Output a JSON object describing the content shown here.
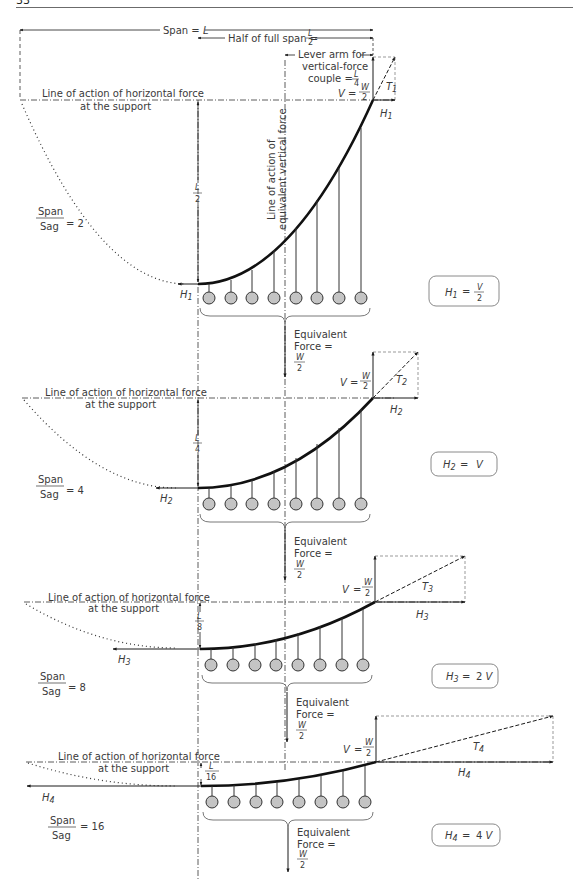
{
  "header": {
    "page_number": "33"
  },
  "top_dimensions": {
    "span": "Span = L",
    "half_span": "Half of full span = L/2",
    "lever_arm_line1": "Lever arm for",
    "lever_arm_line2": "vertical-force",
    "lever_arm_line3": "couple = L/4",
    "line_of_action_vertical": "Line of action of equivalent vertical force"
  },
  "common": {
    "horizontal_force_line1": "Line of action of horizontal force",
    "horizontal_force_line2": "at the support",
    "equivalent_line1": "Equivalent",
    "equivalent_line2": "Force =",
    "W": "W",
    "two": "2",
    "V_eq": "V  =",
    "span": "Span",
    "sag": "Sag",
    "L": "L"
  },
  "panels": [
    {
      "ratio": "= 2",
      "sag_den": "2",
      "H": "H₁",
      "T": "T₁",
      "formula": "H₁  =  V / 2"
    },
    {
      "ratio": "= 4",
      "sag_den": "4",
      "H": "H₂",
      "T": "T₂",
      "formula": "H₂  =  V"
    },
    {
      "ratio": "= 8",
      "sag_den": "8",
      "H": "H₃",
      "T": "T₃",
      "formula": "H₃  =  2 V"
    },
    {
      "ratio": "= 16",
      "sag_den": "16",
      "H": "H₄",
      "T": "T₄",
      "formula": "H₄  =  4 V"
    }
  ],
  "colors": {
    "line": "#1a1a1a",
    "weight_fill": "#c4c4c4",
    "text": "#3a3a3a",
    "box_border": "#8a8a8a"
  }
}
